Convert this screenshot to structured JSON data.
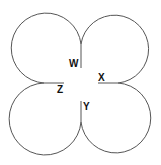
{
  "diagram": {
    "labels": {
      "w": "W",
      "x": "X",
      "y": "Y",
      "z": "Z"
    },
    "colors": {
      "stroke": "#555555",
      "text": "#111111",
      "background": "#ffffff"
    }
  }
}
